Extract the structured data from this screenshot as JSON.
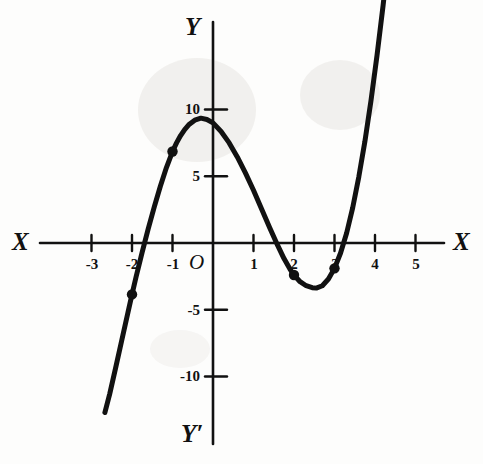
{
  "figure": {
    "kind": "cartesian-graph",
    "width": 483,
    "height": 464,
    "background_color": "#fdfdfc",
    "ink_color": "#111111"
  },
  "axes": {
    "x_axis_label_left": "X",
    "x_axis_label_right": "X",
    "y_axis_label_top": "Y",
    "y_axis_label_bottom": "Y′",
    "origin_label": "O",
    "x_ticks": [
      "-3",
      "-2",
      "-1",
      "1",
      "2",
      "3",
      "4",
      "5"
    ],
    "y_ticks": [
      "10",
      "5",
      "-5",
      "-10"
    ]
  },
  "chart_data": {
    "type": "line",
    "title": "",
    "xlabel": "X",
    "ylabel": "Y",
    "xlim": [
      -3.7,
      5.6
    ],
    "ylim": [
      -13.5,
      15.0
    ],
    "grid": false,
    "legend": "none",
    "x_tick_values": [
      -3,
      -2,
      -1,
      1,
      2,
      3,
      4,
      5
    ],
    "x_tick_labels": [
      "-3",
      "-2",
      "-1",
      "1",
      "2",
      "3",
      "4",
      "5"
    ],
    "y_tick_values": [
      10,
      5,
      -5,
      -10
    ],
    "y_tick_labels": [
      "10",
      "5",
      "-5",
      "-10"
    ],
    "series": [
      {
        "name": "cubic curve",
        "x": [
          -2.67,
          -2.55,
          -2.4,
          -2.25,
          -2.1,
          -2.0,
          -1.9,
          -1.75,
          -1.6,
          -1.45,
          -1.3,
          -1.15,
          -1.0,
          -0.9,
          -0.8,
          -0.7,
          -0.6,
          -0.45,
          -0.3,
          -0.15,
          0.0,
          0.2,
          0.4,
          0.6,
          0.8,
          1.0,
          1.2,
          1.4,
          1.6,
          1.75,
          1.9,
          2.0,
          2.15,
          2.3,
          2.45,
          2.55,
          2.7,
          2.85,
          3.0,
          3.15,
          3.3,
          3.45,
          3.6,
          3.75,
          3.9,
          4.05,
          4.2,
          4.35
        ],
        "y": [
          -12.7,
          -11.3,
          -9.3,
          -7.25,
          -5.2,
          -3.85,
          -2.55,
          -0.7,
          1.05,
          2.7,
          4.25,
          5.65,
          6.85,
          7.5,
          8.05,
          8.5,
          8.85,
          9.2,
          9.35,
          9.25,
          9.0,
          8.35,
          7.5,
          6.45,
          5.25,
          3.95,
          2.55,
          1.15,
          -0.2,
          -1.15,
          -1.95,
          -2.4,
          -2.9,
          -3.2,
          -3.35,
          -3.38,
          -3.2,
          -2.7,
          -1.9,
          -0.75,
          0.75,
          2.65,
          4.95,
          7.6,
          10.65,
          14.05,
          17.8,
          21.9
        ],
        "line_width_px": 5,
        "color": "#111111"
      }
    ],
    "marked_points": [
      {
        "label": "point-at-x-minus-2",
        "x": -2.0,
        "y": -3.85
      },
      {
        "label": "point-at-x-minus-1",
        "x": -1.0,
        "y": 6.85
      },
      {
        "label": "point-at-x-2",
        "x": 2.0,
        "y": -2.4
      },
      {
        "label": "point-at-x-3",
        "x": 3.0,
        "y": -1.9
      }
    ],
    "features": {
      "local_maximum": {
        "x": -0.3,
        "y": 9.4
      },
      "local_minimum": {
        "x": 2.55,
        "y": -3.4
      },
      "x_intercepts": [
        -1.66,
        1.58,
        3.23
      ],
      "y_intercept": 9.0
    }
  }
}
